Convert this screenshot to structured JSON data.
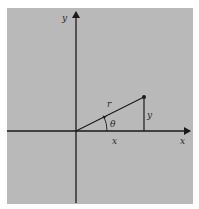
{
  "diagram": {
    "type": "polar-coordinates-right-triangle",
    "colors": {
      "background": "#ffffff",
      "panel": "#b9b9b9",
      "ink": "#1a1a1a"
    },
    "labels": {
      "y_axis": "y",
      "x_axis": "x",
      "radius": "r",
      "angle": "θ",
      "opposite_side": "y",
      "adjacent_side": "x"
    },
    "geometry": {
      "origin": [
        76,
        131
      ],
      "point": [
        144,
        97
      ]
    }
  }
}
